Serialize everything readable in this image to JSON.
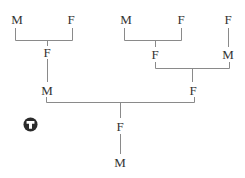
{
  "diagram": {
    "type": "pedigree",
    "nodes": [
      {
        "id": "n1",
        "label": "M",
        "x": 17,
        "y": 19
      },
      {
        "id": "n2",
        "label": "F",
        "x": 71,
        "y": 19
      },
      {
        "id": "n3",
        "label": "M",
        "x": 126,
        "y": 19
      },
      {
        "id": "n4",
        "label": "F",
        "x": 181,
        "y": 19
      },
      {
        "id": "n5",
        "label": "F",
        "x": 228,
        "y": 19
      },
      {
        "id": "n6",
        "label": "F",
        "x": 47,
        "y": 52
      },
      {
        "id": "n7",
        "label": "F",
        "x": 155,
        "y": 54
      },
      {
        "id": "n8",
        "label": "M",
        "x": 228,
        "y": 54
      },
      {
        "id": "n9",
        "label": "M",
        "x": 47,
        "y": 90
      },
      {
        "id": "n10",
        "label": "F",
        "x": 193,
        "y": 90
      },
      {
        "id": "n11",
        "label": "F",
        "x": 120,
        "y": 126
      },
      {
        "id": "n12",
        "label": "M",
        "x": 120,
        "y": 162
      }
    ],
    "edges": [
      {
        "parents": [
          "n1",
          "n2"
        ],
        "child": "n6"
      },
      {
        "parents": [
          "n3",
          "n4"
        ],
        "child": "n7"
      },
      {
        "parents": [
          "n5"
        ],
        "child": "n8"
      },
      {
        "parents": [
          "n6"
        ],
        "child": "n9"
      },
      {
        "parents": [
          "n7",
          "n8"
        ],
        "child": "n10"
      },
      {
        "parents": [
          "n9",
          "n10"
        ],
        "child": "n11"
      },
      {
        "parents": [
          "n11"
        ],
        "child": "n12"
      }
    ],
    "icon": "t-circle-icon",
    "line_color": "#888888",
    "text_color": "#333333"
  }
}
